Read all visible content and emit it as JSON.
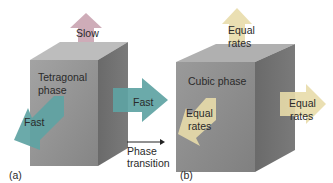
{
  "figure": {
    "panel_a": {
      "label": "(a)",
      "phase_name_line1": "Tetragonal",
      "phase_name_line2": "phase",
      "arrows": {
        "up": {
          "label": "Slow",
          "color": "#c9a3b0"
        },
        "right": {
          "label": "Fast",
          "color": "#5ea3a3"
        },
        "front_left": {
          "label": "Fast",
          "color": "#5ea3a3"
        }
      }
    },
    "transition": {
      "line1": "Phase",
      "line2": "transition"
    },
    "panel_b": {
      "label": "(b)",
      "phase_name": "Cubic phase",
      "arrows": {
        "up": {
          "label_line1": "Equal",
          "label_line2": "rates",
          "color": "#e8dcaa"
        },
        "right": {
          "label_line1": "Equal",
          "label_line2": "rates",
          "color": "#e8dcaa"
        },
        "front_left": {
          "label_line1": "Equal",
          "label_line2": "rates",
          "color": "#e8dcaa"
        }
      }
    },
    "colors": {
      "cube_front": "#8f8f8f",
      "cube_top": "#b5b5b5",
      "cube_side": "#6e6e6e",
      "text": "#2a2a2a"
    }
  }
}
